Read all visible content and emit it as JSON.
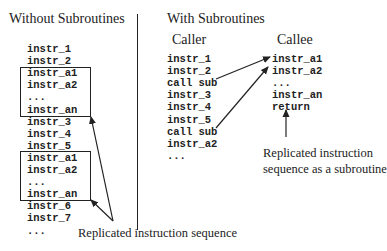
{
  "left": {
    "title": "Without Subroutines",
    "lines": [
      "instr_1",
      "instr_2",
      "instr_a1",
      "instr_a2",
      "...",
      "instr_an",
      "instr_3",
      "instr_4",
      "instr_5",
      "instr_a1",
      "instr_a2",
      "...",
      "instr_an",
      "instr_6",
      "instr_7",
      "..."
    ],
    "caption": "Replicated instruction sequence"
  },
  "right": {
    "title": "With Subroutines",
    "caller": {
      "label": "Caller",
      "lines": [
        "instr_1",
        "instr_2",
        "call sub",
        "instr_3",
        "instr_4",
        "instr_5",
        "call sub",
        "instr_a2",
        "..."
      ]
    },
    "callee": {
      "label": "Callee",
      "lines": [
        "instr_a1",
        "instr_a2",
        "...",
        "instr_an",
        "return"
      ]
    },
    "caption_line1": "Replicated instruction",
    "caption_line2": "sequence as a subroutine"
  }
}
